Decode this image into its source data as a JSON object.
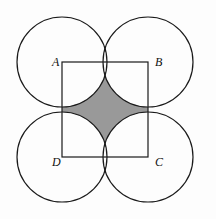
{
  "figure": {
    "canvas": {
      "width": 216,
      "height": 219,
      "background": "#fdfdfd"
    },
    "colors": {
      "stroke": "#1a1a1a",
      "shaded_region_fill": "#999999",
      "circle_fill": "none",
      "square_fill": "none",
      "label_color": "#111111"
    },
    "square": {
      "name": "ABCD",
      "side_length_px": 86,
      "stroke_width": 1.2,
      "corners": {
        "A": {
          "x": 62,
          "y": 62
        },
        "B": {
          "x": 148,
          "y": 62
        },
        "C": {
          "x": 148,
          "y": 157
        },
        "D": {
          "x": 62,
          "y": 157
        }
      },
      "center": {
        "x": 105,
        "y": 109.5
      }
    },
    "circles": [
      {
        "id": "circle-at-A",
        "cx": 62,
        "cy": 62,
        "r": 45
      },
      {
        "id": "circle-at-B",
        "cx": 148,
        "cy": 62,
        "r": 45
      },
      {
        "id": "circle-at-C",
        "cx": 148,
        "cy": 157,
        "r": 45
      },
      {
        "id": "circle-at-D",
        "cx": 62,
        "cy": 157,
        "r": 45
      }
    ],
    "shaded_region": {
      "description": "Region inside square ABCD but outside all four corner circles",
      "fill": "#999999",
      "cusps": [
        {
          "x": 105,
          "y": 62
        },
        {
          "x": 148,
          "y": 109.5
        },
        {
          "x": 105,
          "y": 157
        },
        {
          "x": 62,
          "y": 109.5
        }
      ]
    },
    "labels": [
      {
        "id": "label-A",
        "text": "A",
        "x": 52,
        "y": 65,
        "anchor_corner": "A"
      },
      {
        "id": "label-B",
        "text": "B",
        "x": 155,
        "y": 65,
        "anchor_corner": "B"
      },
      {
        "id": "label-C",
        "text": "C",
        "x": 155,
        "y": 166,
        "anchor_corner": "C"
      },
      {
        "id": "label-D",
        "text": "D",
        "x": 52,
        "y": 166,
        "anchor_corner": "D"
      }
    ]
  }
}
